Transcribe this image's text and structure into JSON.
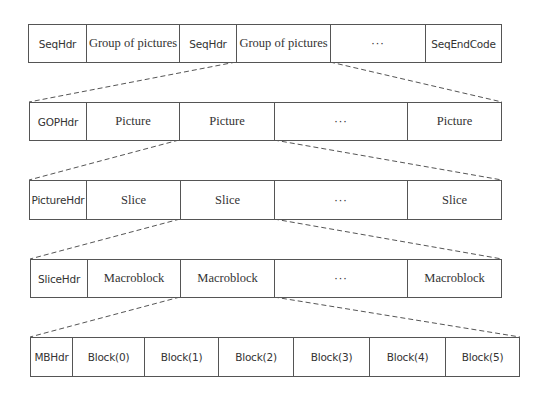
{
  "diagram": {
    "type": "hierarchical-bitstream-structure",
    "line_color": "#555555",
    "rows": [
      {
        "id": "sequence",
        "cells": [
          {
            "label": "SeqHdr",
            "style": "sans"
          },
          {
            "label": "Group of pictures",
            "style": "serif"
          },
          {
            "label": "SeqHdr",
            "style": "sans"
          },
          {
            "label": "Group of pictures",
            "style": "serif"
          },
          {
            "label": "···",
            "style": "dots"
          },
          {
            "label": "SeqEndCode",
            "style": "sans"
          }
        ]
      },
      {
        "id": "group-of-pictures",
        "cells": [
          {
            "label": "GOPHdr",
            "style": "sans"
          },
          {
            "label": "Picture",
            "style": "serif"
          },
          {
            "label": "Picture",
            "style": "serif"
          },
          {
            "label": "···",
            "style": "dots"
          },
          {
            "label": "Picture",
            "style": "serif"
          }
        ]
      },
      {
        "id": "picture",
        "cells": [
          {
            "label": "PictureHdr",
            "style": "sans"
          },
          {
            "label": "Slice",
            "style": "serif"
          },
          {
            "label": "Slice",
            "style": "serif"
          },
          {
            "label": "···",
            "style": "dots"
          },
          {
            "label": "Slice",
            "style": "serif"
          }
        ]
      },
      {
        "id": "slice",
        "cells": [
          {
            "label": "SliceHdr",
            "style": "sans"
          },
          {
            "label": "Macroblock",
            "style": "serif"
          },
          {
            "label": "Macroblock",
            "style": "serif"
          },
          {
            "label": "···",
            "style": "dots"
          },
          {
            "label": "Macroblock",
            "style": "serif"
          }
        ]
      },
      {
        "id": "macroblock",
        "cells": [
          {
            "label": "MBHdr",
            "style": "sans"
          },
          {
            "label": "Block(0)",
            "style": "sans"
          },
          {
            "label": "Block(1)",
            "style": "sans"
          },
          {
            "label": "Block(2)",
            "style": "sans"
          },
          {
            "label": "Block(3)",
            "style": "sans"
          },
          {
            "label": "Block(4)",
            "style": "sans"
          },
          {
            "label": "Block(5)",
            "style": "sans"
          }
        ]
      }
    ],
    "expansions": [
      {
        "from_row": "sequence",
        "from_cell": "Group of pictures (2nd)",
        "to_row": "group-of-pictures"
      },
      {
        "from_row": "group-of-pictures",
        "from_cell": "Picture (2nd)",
        "to_row": "picture"
      },
      {
        "from_row": "picture",
        "from_cell": "Slice (2nd)",
        "to_row": "slice"
      },
      {
        "from_row": "slice",
        "from_cell": "Macroblock (2nd)",
        "to_row": "macroblock"
      }
    ]
  }
}
